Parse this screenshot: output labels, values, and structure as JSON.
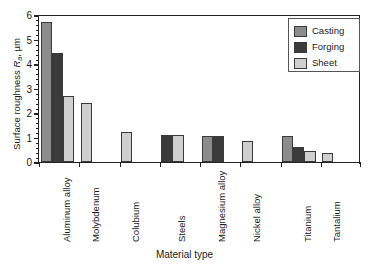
{
  "chart_data": {
    "type": "bar",
    "title": "",
    "xlabel": "Material type",
    "ylabel": "Surface roughness Ra, um",
    "ylabel_parts": {
      "prefix": "Surface roughness ",
      "symbol": "R",
      "subscript": "a",
      "suffix": ", µm"
    },
    "ylim": [
      0,
      6
    ],
    "yticks": [
      0,
      1,
      2,
      3,
      4,
      5,
      6
    ],
    "ytick_labels": [
      "0",
      "1",
      "2",
      "3",
      "4",
      "5",
      "6"
    ],
    "minor_ticks": true,
    "grid": false,
    "legend_position": "top-right",
    "categories": [
      "Aluminum alloy",
      "Molybdenum",
      "Colubium",
      "Steels",
      "Magnesium alloy",
      "Nickel alloy",
      "Titanium",
      "Tantalium"
    ],
    "series": [
      {
        "name": "Casting",
        "color": "#8c8c8c",
        "values": [
          5.7,
          null,
          null,
          null,
          1.05,
          null,
          1.08,
          null
        ]
      },
      {
        "name": "Forging",
        "color": "#3b3b3b",
        "values": [
          4.45,
          null,
          null,
          1.1,
          1.05,
          null,
          0.63,
          null
        ]
      },
      {
        "name": "Sheet",
        "color": "#cfcfcf",
        "values": [
          2.68,
          2.4,
          1.22,
          1.1,
          null,
          0.85,
          0.45,
          0.35
        ]
      }
    ]
  },
  "legend": {
    "items": [
      {
        "label": "Casting",
        "color": "#8c8c8c"
      },
      {
        "label": "Forging",
        "color": "#3b3b3b"
      },
      {
        "label": "Sheet",
        "color": "#cfcfcf"
      }
    ]
  },
  "axes": {
    "y_title": "Surface roughness ",
    "y_symbol": "R",
    "y_subscript": "a",
    "y_units": ", µm",
    "x_title": "Material type"
  }
}
